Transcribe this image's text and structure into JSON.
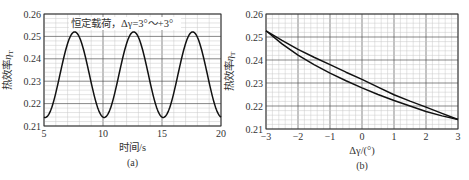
{
  "chart_data": [
    {
      "id": "a",
      "type": "line",
      "sublabel": "(a)",
      "title": "",
      "annotation": "恒定载荷，Δγ=3°～+3°",
      "xlabel": "时间/s",
      "ylabel": "热效率η_T",
      "ylabel_main": "热效率",
      "ylabel_sym": "η",
      "ylabel_sub": "T",
      "xlim": [
        5,
        20
      ],
      "ylim": [
        0.21,
        0.26
      ],
      "xticks": [
        5,
        10,
        15,
        20
      ],
      "xtick_labels": [
        "5",
        "10",
        "15",
        "20"
      ],
      "yticks": [
        0.21,
        0.22,
        0.23,
        0.24,
        0.25,
        0.26
      ],
      "ytick_labels": [
        "0.21",
        "0.22",
        "0.23",
        "0.24",
        "0.25",
        "0.26"
      ],
      "x_minor_step": 1,
      "y_minor_step": 0.002,
      "grid": true,
      "series": [
        {
          "name": "thermal efficiency vs time",
          "model": "sinusoid",
          "mean": 0.2329,
          "amplitude": 0.0191,
          "period": 5.0,
          "peak_times": [
            7.6,
            12.6,
            17.6
          ],
          "trough_times": [
            5.1,
            10.1,
            15.1,
            20.1
          ],
          "x": [
            5.0,
            5.5,
            6.0,
            6.5,
            7.0,
            7.6,
            8.2,
            8.7,
            9.2,
            9.6,
            10.1,
            10.6,
            11.0,
            11.5,
            12.0,
            12.6,
            13.2,
            13.7,
            14.2,
            14.6,
            15.1,
            15.6,
            16.0,
            16.5,
            17.0,
            17.6,
            18.2,
            18.7,
            19.2,
            19.6,
            20.0
          ],
          "y": [
            0.2139,
            0.2176,
            0.2267,
            0.2374,
            0.2467,
            0.252,
            0.2467,
            0.2374,
            0.2267,
            0.2188,
            0.2138,
            0.2176,
            0.2241,
            0.2347,
            0.2448,
            0.252,
            0.2467,
            0.2374,
            0.2267,
            0.2188,
            0.2138,
            0.2176,
            0.2241,
            0.2347,
            0.2448,
            0.252,
            0.2467,
            0.2374,
            0.2267,
            0.2188,
            0.214
          ]
        }
      ]
    },
    {
      "id": "b",
      "type": "line",
      "sublabel": "(b)",
      "title": "",
      "xlabel": "Δγ/(°)",
      "ylabel": "热效率η_T",
      "ylabel_main": "热效率",
      "ylabel_sym": "η",
      "ylabel_sub": "T",
      "xlim": [
        -3,
        3
      ],
      "ylim": [
        0.21,
        0.26
      ],
      "xticks": [
        -3,
        -2,
        -1,
        0,
        1,
        2,
        3
      ],
      "xtick_labels": [
        "−3",
        "−2",
        "−1",
        "0",
        "1",
        "2",
        "3"
      ],
      "yticks": [
        0.21,
        0.22,
        0.23,
        0.24,
        0.25,
        0.26
      ],
      "ytick_labels": [
        "0.21",
        "0.22",
        "0.23",
        "0.24",
        "0.25",
        "0.26"
      ],
      "x_minor_step": 0.2,
      "y_minor_step": 0.002,
      "grid": true,
      "series": [
        {
          "name": "upper branch (hysteresis loop)",
          "x": [
            -3,
            -2.5,
            -2,
            -1.5,
            -1,
            -0.5,
            0,
            0.5,
            1,
            1.5,
            2,
            2.5,
            3
          ],
          "y": [
            0.2527,
            0.2485,
            0.2446,
            0.2412,
            0.238,
            0.2347,
            0.2316,
            0.2282,
            0.2249,
            0.2221,
            0.2195,
            0.2168,
            0.2141
          ]
        },
        {
          "name": "lower branch (hysteresis loop)",
          "x": [
            -3,
            -2.5,
            -2,
            -1.5,
            -1,
            -0.5,
            0,
            0.5,
            1,
            1.5,
            2,
            2.5,
            3
          ],
          "y": [
            0.2527,
            0.247,
            0.2421,
            0.238,
            0.2343,
            0.231,
            0.2279,
            0.225,
            0.2224,
            0.22,
            0.2176,
            0.2157,
            0.2141
          ]
        }
      ]
    }
  ],
  "panels": [
    {
      "id": "a",
      "plot_box": {
        "left": 44,
        "top": 14,
        "right": 221,
        "bottom": 126
      }
    },
    {
      "id": "b",
      "plot_box": {
        "left": 266,
        "top": 14,
        "right": 458,
        "bottom": 129
      }
    }
  ]
}
